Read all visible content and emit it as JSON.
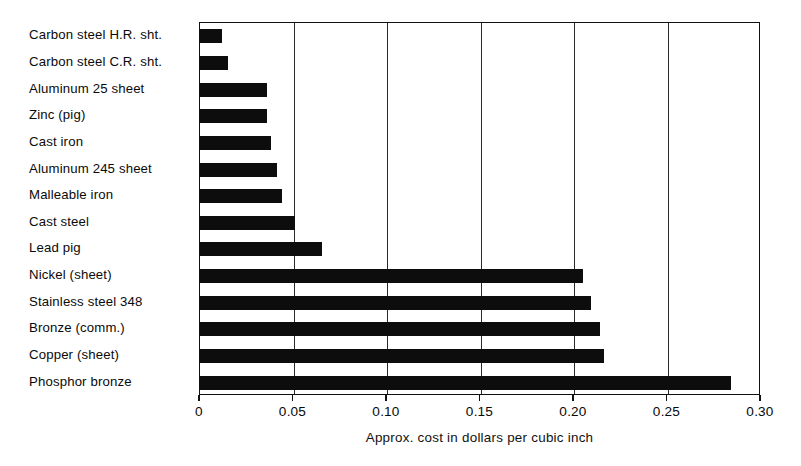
{
  "chart_data": {
    "type": "bar",
    "orientation": "horizontal",
    "title": "",
    "xlabel": "Approx. cost in dollars per cubic inch",
    "ylabel": "",
    "xlim": [
      0,
      0.3
    ],
    "xticks": [
      0,
      0.05,
      0.1,
      0.15,
      0.2,
      0.25,
      0.3
    ],
    "xtick_labels": [
      "0",
      "0.05",
      "0.10",
      "0.15",
      "0.20",
      "0.25",
      "0.30"
    ],
    "grid": "vertical",
    "legend": "none",
    "bar_color": "#0d0d0d",
    "categories": [
      "Carbon steel H.R. sht.",
      "Carbon steel C.R. sht.",
      "Aluminum 25 sheet",
      "Zinc (pig)",
      "Cast iron",
      "Aluminum 245 sheet",
      "Malleable iron",
      "Cast steel",
      "Lead pig",
      "Nickel (sheet)",
      "Stainless steel 348",
      "Bronze (comm.)",
      "Copper (sheet)",
      "Phosphor bronze"
    ],
    "values": [
      0.012,
      0.015,
      0.036,
      0.036,
      0.038,
      0.041,
      0.044,
      0.051,
      0.065,
      0.205,
      0.209,
      0.214,
      0.216,
      0.284
    ]
  }
}
